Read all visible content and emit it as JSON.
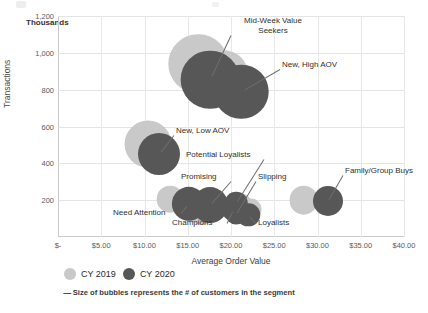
{
  "chart_data": {
    "type": "scatter",
    "title": "",
    "xlabel": "Average Order Value",
    "ylabel": "Transactions",
    "y_unit_label": "Thousands",
    "xlim": [
      0,
      40
    ],
    "ylim": [
      0,
      1200
    ],
    "xticks": [
      "$-",
      "$5.00",
      "$10.00",
      "$15.00",
      "$20.00",
      "$25.00",
      "$30.00",
      "$35.00",
      "$40.00"
    ],
    "xtick_values": [
      0,
      5,
      10,
      15,
      20,
      25,
      30,
      35,
      40
    ],
    "yticks": [
      "200",
      "400",
      "600",
      "800",
      "1,000",
      "1,200"
    ],
    "ytick_values": [
      200,
      400,
      600,
      800,
      1000,
      1200
    ],
    "grid": true,
    "legend_position": "bottom-left",
    "series": [
      {
        "name": "CY 2019",
        "color": "#c9c9c9",
        "points": [
          {
            "segment": "Mid-Week Value Seekers",
            "x": 16.2,
            "y": 940,
            "size": 900000
          },
          {
            "segment": "New, High AOV",
            "x": 19.1,
            "y": 880,
            "size": 620000
          },
          {
            "segment": "New, Low AOV",
            "x": 10.4,
            "y": 505,
            "size": 560000
          },
          {
            "segment": "Need Attention",
            "x": 13.0,
            "y": 205,
            "size": 180000
          },
          {
            "segment": "Promising",
            "x": 15.6,
            "y": 165,
            "size": 250000
          },
          {
            "segment": "Champions",
            "x": 16.7,
            "y": 140,
            "size": 200000
          },
          {
            "segment": "Potential Loyalists",
            "x": 21.0,
            "y": 175,
            "size": 150000
          },
          {
            "segment": "Slipping",
            "x": 21.5,
            "y": 160,
            "size": 120000
          },
          {
            "segment": "Loyalists",
            "x": 22.3,
            "y": 150,
            "size": 110000
          },
          {
            "segment": "Family/Group Buys",
            "x": 28.4,
            "y": 200,
            "size": 210000
          }
        ]
      },
      {
        "name": "CY 2020",
        "color": "#575757",
        "points": [
          {
            "segment": "Mid-Week Value Seekers",
            "x": 17.6,
            "y": 855,
            "size": 880000
          },
          {
            "segment": "New, High AOV",
            "x": 21.2,
            "y": 790,
            "size": 760000
          },
          {
            "segment": "New, Low AOV",
            "x": 11.7,
            "y": 450,
            "size": 450000
          },
          {
            "segment": "Need Attention",
            "x": 15.1,
            "y": 180,
            "size": 300000
          },
          {
            "segment": "Promising",
            "x": 17.6,
            "y": 175,
            "size": 330000
          },
          {
            "segment": "Champions",
            "x": 20.3,
            "y": 150,
            "size": 160000
          },
          {
            "segment": "Potential Loyalists",
            "x": 20.6,
            "y": 185,
            "size": 130000
          },
          {
            "segment": "Slipping",
            "x": 20.6,
            "y": 125,
            "size": 110000
          },
          {
            "segment": "Loyalists",
            "x": 22.0,
            "y": 120,
            "size": 140000
          },
          {
            "segment": "Family/Group Buys",
            "x": 31.2,
            "y": 195,
            "size": 230000
          }
        ]
      }
    ],
    "annotations": [
      {
        "text": "Mid-Week Value Seekers",
        "target_segment": "Mid-Week Value Seekers"
      },
      {
        "text": "New, High AOV",
        "target_segment": "New, High AOV"
      },
      {
        "text": "New, Low AOV",
        "target_segment": "New, Low AOV"
      },
      {
        "text": "Potential Loyalists",
        "target_segment": "Potential Loyalists"
      },
      {
        "text": "Promising",
        "target_segment": "Promising"
      },
      {
        "text": "Slipping",
        "target_segment": "Slipping"
      },
      {
        "text": "Need Attention",
        "target_segment": "Need Attention"
      },
      {
        "text": "Champions",
        "target_segment": "Champions"
      },
      {
        "text": "Loyalists",
        "target_segment": "Loyalists"
      },
      {
        "text": "Family/Group Buys",
        "target_segment": "Family/Group Buys"
      }
    ]
  },
  "axes": {
    "y_unit": "Thousands",
    "y_title": "Transactions",
    "x_title": "Average Order Value",
    "yticks": [
      "1,200",
      "1,000",
      "800",
      "600",
      "400",
      "200"
    ],
    "xticks": [
      "$-",
      "$5.00",
      "$10.00",
      "$15.00",
      "$20.00",
      "$25.00",
      "$30.00",
      "$35.00",
      "$40.00"
    ]
  },
  "legend": {
    "items": [
      {
        "label": "CY 2019",
        "color": "#c9c9c9"
      },
      {
        "label": "CY 2020",
        "color": "#575757"
      }
    ]
  },
  "footnote": {
    "dash": "-----",
    "text": "Size of bubbles represents the # of customers in the segment"
  },
  "annotations": {
    "mid_week_line1": "Mid-Week Value",
    "mid_week_line2": "Seekers",
    "new_high_aov": "New, High AOV",
    "new_low_aov": "New, Low AOV",
    "potential_loyalists": "Potential Loyalists",
    "promising": "Promising",
    "slipping": "Slipping",
    "need_attention": "Need Attention",
    "champions": "Champions",
    "loyalists": "Loyalists",
    "family_group_buys": "Family/Group Buys"
  },
  "colors": {
    "cy2019": "#c9c9c9",
    "cy2020": "#575757",
    "grid": "#e4e4e4",
    "axis": "#c9c9c9"
  }
}
